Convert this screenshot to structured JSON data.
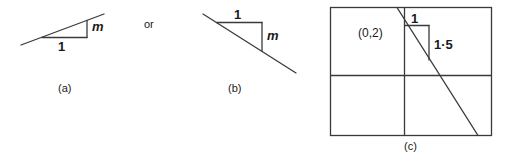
{
  "figure": {
    "background_color": "#ffffff",
    "stroke_color": "#3a3a3a",
    "text_color": "#1a1a1a",
    "connector_text": "or",
    "panels": [
      {
        "id": "a",
        "caption": "(a)",
        "description": "upward sloping line with gradient triangle, run 1 and rise m",
        "labels": {
          "run": "1",
          "rise": "m"
        }
      },
      {
        "id": "b",
        "caption": "(b)",
        "description": "downward sloping line with gradient triangle, run 1 and drop m",
        "labels": {
          "run": "1",
          "rise": "m"
        }
      },
      {
        "id": "c",
        "caption": "(c)",
        "description": "coordinate grid frame with a line through (0,2) falling 1.5 for every 1 across",
        "labels": {
          "intercept": "(0,2)",
          "run": "1",
          "rise": "1·5"
        }
      }
    ]
  }
}
